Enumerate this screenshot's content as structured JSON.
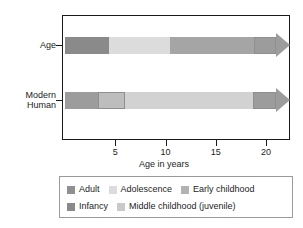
{
  "chart_data": {
    "type": "bar",
    "title": "",
    "xlabel": "Age in years",
    "ylabel": "",
    "orientation": "horizontal",
    "xlim": [
      0,
      22.5
    ],
    "grid": false,
    "legend_position": "below",
    "categories": [
      "Age",
      "Modern Human"
    ],
    "xticks": [
      5,
      10,
      15,
      20
    ],
    "xtick_labels": [
      "5",
      "10",
      "15",
      "20"
    ],
    "stages": [
      {
        "key": "adult",
        "label": "Adult",
        "color": "#909090"
      },
      {
        "key": "adolescence",
        "label": "Adolescence",
        "color": "#dcdcdc"
      },
      {
        "key": "early_childhood",
        "label": "Early childhood",
        "color": "#b9b9b9"
      },
      {
        "key": "infancy",
        "label": "Infancy",
        "color": "#8a8a8a"
      },
      {
        "key": "middle_childhood",
        "label": "Middle childhood (juvenile)",
        "color": "#c9c9c9"
      }
    ],
    "series": [
      {
        "name": "Age",
        "segments": [
          {
            "stage": "infancy",
            "label": "Infancy",
            "start": 0,
            "end": 4.4,
            "color": "#8a8a8a",
            "outlined": false
          },
          {
            "stage": "middle_childhood",
            "label": "Middle childhood (juvenile)",
            "start": 4.4,
            "end": 10.4,
            "color": "#dcdcdc",
            "outlined": false
          },
          {
            "stage": "adolescence",
            "label": "Adolescence",
            "start": 10.4,
            "end": 18.8,
            "color": "#a5a5a5",
            "outlined": false
          },
          {
            "stage": "adult",
            "label": "Adult",
            "start": 18.8,
            "end": 22.3,
            "color": "#9c9c9c",
            "outlined": true,
            "arrow": true
          }
        ]
      },
      {
        "name": "Modern Human",
        "segments": [
          {
            "stage": "infancy",
            "label": "Infancy",
            "start": 0,
            "end": 3.3,
            "color": "#9c9c9c",
            "outlined": false
          },
          {
            "stage": "early_childhood",
            "label": "Early childhood",
            "start": 3.3,
            "end": 6.0,
            "color": "#bdbdbd",
            "outlined": true
          },
          {
            "stage": "middle_childhood",
            "label": "Middle childhood (juvenile)",
            "start": 6.0,
            "end": 18.7,
            "color": "#d2d2d2",
            "outlined": false
          },
          {
            "stage": "adult",
            "label": "Adult",
            "start": 18.7,
            "end": 22.3,
            "color": "#9c9c9c",
            "outlined": true,
            "arrow": true
          }
        ]
      }
    ]
  },
  "axis": {
    "y_labels": [
      {
        "line1": "Age",
        "line2": ""
      },
      {
        "line1": "Modern",
        "line2": "Human"
      }
    ],
    "x_title": "Age in years",
    "tick_5": "5",
    "tick_10": "10",
    "tick_15": "15",
    "tick_20": "20"
  },
  "legend": {
    "row1": [
      {
        "label": "Adult",
        "color": "#909090"
      },
      {
        "label": "Adolescence",
        "color": "#dcdcdc"
      },
      {
        "label": "Early childhood",
        "color": "#b2b2b2"
      }
    ],
    "row2": [
      {
        "label": "Infancy",
        "color": "#8a8a8a"
      },
      {
        "label": "Middle childhood (juvenile)",
        "color": "#c9c9c9"
      }
    ]
  }
}
